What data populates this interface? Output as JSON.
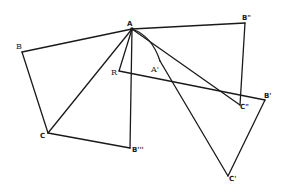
{
  "diagram": {
    "type": "geometry-construction",
    "stroke_color": "#1a1a1a",
    "background": "#ffffff",
    "points": {
      "A": {
        "label": "A",
        "x": 132,
        "y": 29
      },
      "B": {
        "label": "B",
        "x": 22,
        "y": 52
      },
      "B2": {
        "label": "B\"",
        "x": 245,
        "y": 23
      },
      "R": {
        "label": "R",
        "x": 119,
        "y": 71
      },
      "A1": {
        "label": "A'",
        "x": 160,
        "y": 61
      },
      "C": {
        "label": "C",
        "x": 48,
        "y": 133
      },
      "B3": {
        "label": "B'''",
        "x": 130,
        "y": 148
      },
      "C2": {
        "label": "C\"",
        "x": 240,
        "y": 105
      },
      "B1": {
        "label": "B'",
        "x": 265,
        "y": 100
      },
      "C1": {
        "label": "C'",
        "x": 228,
        "y": 176
      }
    },
    "segments": [
      [
        "A",
        "B"
      ],
      [
        "B",
        "C"
      ],
      [
        "C",
        "A"
      ],
      [
        "C",
        "B3"
      ],
      [
        "B3",
        "A"
      ],
      [
        "A",
        "B2"
      ],
      [
        "B2",
        "C2"
      ],
      [
        "A",
        "C2"
      ],
      [
        "A",
        "R"
      ],
      [
        "R",
        "B1"
      ],
      [
        "B1",
        "C1"
      ],
      [
        "A1",
        "C1"
      ]
    ],
    "arcs": [
      {
        "from": "A",
        "to": "A1",
        "description": "short arc from A curving down to A'"
      }
    ]
  }
}
